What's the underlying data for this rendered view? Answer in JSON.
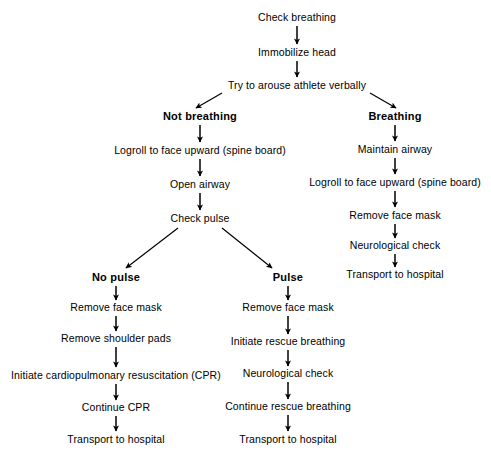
{
  "diagram": {
    "background_color": "#ffffff",
    "text_color": "#000000",
    "arrow_color": "#000000"
  },
  "nodes": [
    {
      "id": "check_breathing",
      "label": "Check breathing",
      "x": 297,
      "y": 17,
      "bold": false
    },
    {
      "id": "immobilize_head",
      "label": "Immobilize head",
      "x": 297,
      "y": 52,
      "bold": false
    },
    {
      "id": "try_arouse",
      "label": "Try to arouse athlete verbally",
      "x": 297,
      "y": 85,
      "bold": false
    },
    {
      "id": "not_breathing",
      "label": "Not breathing",
      "x": 200,
      "y": 116,
      "bold": true
    },
    {
      "id": "logroll_left",
      "label": "Logroll to face upward (spine board)",
      "x": 200,
      "y": 150,
      "bold": false
    },
    {
      "id": "open_airway",
      "label": "Open airway",
      "x": 200,
      "y": 184,
      "bold": false
    },
    {
      "id": "check_pulse",
      "label": "Check pulse",
      "x": 200,
      "y": 218,
      "bold": false
    },
    {
      "id": "breathing",
      "label": "Breathing",
      "x": 395,
      "y": 116,
      "bold": true
    },
    {
      "id": "maintain_airway",
      "label": "Maintain airway",
      "x": 395,
      "y": 149,
      "bold": false
    },
    {
      "id": "logroll_right",
      "label": "Logroll to face upward (spine board)",
      "x": 395,
      "y": 182,
      "bold": false
    },
    {
      "id": "remove_mask_right",
      "label": "Remove face mask",
      "x": 395,
      "y": 215,
      "bold": false
    },
    {
      "id": "neuro_check_right",
      "label": "Neurological check",
      "x": 395,
      "y": 245,
      "bold": false
    },
    {
      "id": "transport_right",
      "label": "Transport to hospital",
      "x": 395,
      "y": 274,
      "bold": false
    },
    {
      "id": "no_pulse",
      "label": "No pulse",
      "x": 116,
      "y": 277,
      "bold": true
    },
    {
      "id": "remove_mask_nopulse",
      "label": "Remove face mask",
      "x": 116,
      "y": 307,
      "bold": false
    },
    {
      "id": "remove_pads",
      "label": "Remove shoulder pads",
      "x": 116,
      "y": 338,
      "bold": false
    },
    {
      "id": "initiate_cpr",
      "label": "Initiate cardiopulmonary resuscitation (CPR)",
      "x": 116,
      "y": 375,
      "bold": false
    },
    {
      "id": "continue_cpr",
      "label": "Continue CPR",
      "x": 116,
      "y": 407,
      "bold": false
    },
    {
      "id": "transport_nopulse",
      "label": "Transport to hospital",
      "x": 116,
      "y": 439,
      "bold": false
    },
    {
      "id": "pulse",
      "label": "Pulse",
      "x": 288,
      "y": 277,
      "bold": true
    },
    {
      "id": "remove_mask_pulse",
      "label": "Remove face mask",
      "x": 288,
      "y": 307,
      "bold": false
    },
    {
      "id": "initiate_rescue",
      "label": "Initiate rescue breathing",
      "x": 288,
      "y": 341,
      "bold": false
    },
    {
      "id": "neuro_check_pulse",
      "label": "Neurological check",
      "x": 288,
      "y": 373,
      "bold": false
    },
    {
      "id": "continue_rescue",
      "label": "Continue rescue breathing",
      "x": 288,
      "y": 406,
      "bold": false
    },
    {
      "id": "transport_pulse",
      "label": "Transport to hospital",
      "x": 288,
      "y": 439,
      "bold": false
    }
  ],
  "edges": [
    {
      "from": "check_breathing",
      "to": "immobilize_head",
      "kind": "vertical",
      "x1": 297,
      "y1": 26,
      "x2": 297,
      "y2": 44
    },
    {
      "from": "immobilize_head",
      "to": "try_arouse",
      "kind": "vertical",
      "x1": 297,
      "y1": 61,
      "x2": 297,
      "y2": 77
    },
    {
      "from": "try_arouse",
      "to": "not_breathing",
      "kind": "diagonal",
      "x1": 222,
      "y1": 93,
      "x2": 196,
      "y2": 108
    },
    {
      "from": "try_arouse",
      "to": "breathing",
      "kind": "diagonal",
      "x1": 370,
      "y1": 93,
      "x2": 396,
      "y2": 108
    },
    {
      "from": "not_breathing",
      "to": "logroll_left",
      "kind": "vertical",
      "x1": 200,
      "y1": 125,
      "x2": 200,
      "y2": 142
    },
    {
      "from": "logroll_left",
      "to": "open_airway",
      "kind": "vertical",
      "x1": 200,
      "y1": 159,
      "x2": 200,
      "y2": 176
    },
    {
      "from": "open_airway",
      "to": "check_pulse",
      "kind": "vertical",
      "x1": 200,
      "y1": 193,
      "x2": 200,
      "y2": 210
    },
    {
      "from": "check_pulse",
      "to": "no_pulse",
      "kind": "diagonal",
      "x1": 178,
      "y1": 228,
      "x2": 126,
      "y2": 268
    },
    {
      "from": "check_pulse",
      "to": "pulse",
      "kind": "diagonal",
      "x1": 222,
      "y1": 228,
      "x2": 272,
      "y2": 268
    },
    {
      "from": "breathing",
      "to": "maintain_airway",
      "kind": "vertical",
      "x1": 395,
      "y1": 125,
      "x2": 395,
      "y2": 141
    },
    {
      "from": "maintain_airway",
      "to": "logroll_right",
      "kind": "vertical",
      "x1": 395,
      "y1": 158,
      "x2": 395,
      "y2": 174
    },
    {
      "from": "logroll_right",
      "to": "remove_mask_right",
      "kind": "vertical",
      "x1": 395,
      "y1": 191,
      "x2": 395,
      "y2": 207
    },
    {
      "from": "remove_mask_right",
      "to": "neuro_check_right",
      "kind": "vertical",
      "x1": 395,
      "y1": 224,
      "x2": 395,
      "y2": 238
    },
    {
      "from": "neuro_check_right",
      "to": "transport_right",
      "kind": "vertical",
      "x1": 395,
      "y1": 254,
      "x2": 395,
      "y2": 267
    },
    {
      "from": "no_pulse",
      "to": "remove_mask_nopulse",
      "kind": "vertical",
      "x1": 116,
      "y1": 286,
      "x2": 116,
      "y2": 300
    },
    {
      "from": "remove_mask_nopulse",
      "to": "remove_pads",
      "kind": "vertical",
      "x1": 116,
      "y1": 316,
      "x2": 116,
      "y2": 331
    },
    {
      "from": "remove_pads",
      "to": "initiate_cpr",
      "kind": "vertical",
      "x1": 116,
      "y1": 347,
      "x2": 116,
      "y2": 367
    },
    {
      "from": "initiate_cpr",
      "to": "continue_cpr",
      "kind": "vertical",
      "x1": 116,
      "y1": 384,
      "x2": 116,
      "y2": 400
    },
    {
      "from": "continue_cpr",
      "to": "transport_nopulse",
      "kind": "vertical",
      "x1": 116,
      "y1": 416,
      "x2": 116,
      "y2": 431
    },
    {
      "from": "pulse",
      "to": "remove_mask_pulse",
      "kind": "vertical",
      "x1": 288,
      "y1": 286,
      "x2": 288,
      "y2": 300
    },
    {
      "from": "remove_mask_pulse",
      "to": "initiate_rescue",
      "kind": "vertical",
      "x1": 288,
      "y1": 316,
      "x2": 288,
      "y2": 334
    },
    {
      "from": "initiate_rescue",
      "to": "neuro_check_pulse",
      "kind": "vertical",
      "x1": 288,
      "y1": 350,
      "x2": 288,
      "y2": 366
    },
    {
      "from": "neuro_check_pulse",
      "to": "continue_rescue",
      "kind": "vertical",
      "x1": 288,
      "y1": 382,
      "x2": 288,
      "y2": 399
    },
    {
      "from": "continue_rescue",
      "to": "transport_pulse",
      "kind": "vertical",
      "x1": 288,
      "y1": 415,
      "x2": 288,
      "y2": 431
    }
  ]
}
